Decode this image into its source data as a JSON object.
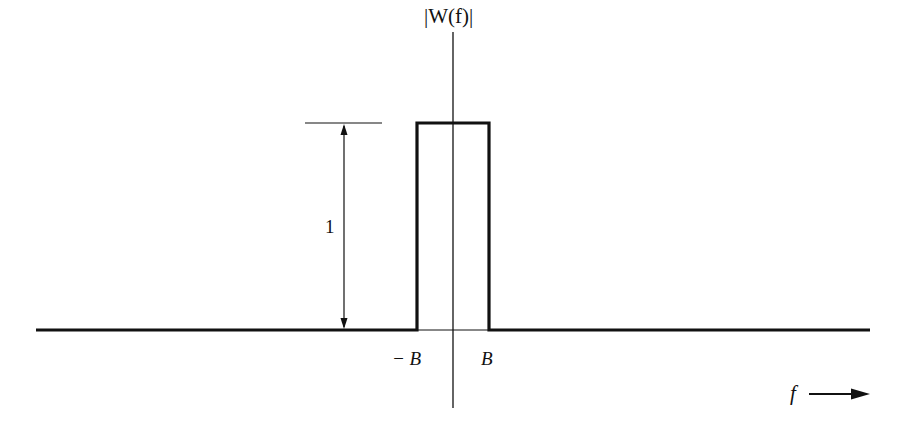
{
  "figure": {
    "title": "|W(f)|",
    "height_label": "1",
    "neg_band_label": "− B",
    "pos_band_label": "B",
    "x_axis_label": "f",
    "colors": {
      "stroke": "#111111",
      "background": "#ffffff"
    }
  },
  "diagram": {
    "type": "rectangular-spectrum",
    "band_edges": [
      "-B",
      "B"
    ],
    "amplitude": 1
  }
}
